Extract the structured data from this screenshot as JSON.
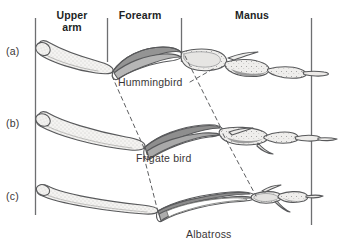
{
  "figure": {
    "background_color": "#ffffff",
    "line_color": "#58595b",
    "bone_fill_light": "#f2f1ef",
    "bone_fill_shadow": "#8e8e8e",
    "text_color": "#3a3637"
  },
  "columns": {
    "headers": [
      {
        "id": "upper-arm",
        "label": "Upper\narm",
        "line1": "Upper",
        "line2": "arm"
      },
      {
        "id": "forearm",
        "label": "Forearm"
      },
      {
        "id": "manus",
        "label": "Manus"
      }
    ],
    "divider_count": 4
  },
  "rows": [
    {
      "id": "a",
      "label": "(a)",
      "species": "Hummingbird"
    },
    {
      "id": "b",
      "label": "(b)",
      "species": "Frigate bird"
    },
    {
      "id": "c",
      "label": "(c)",
      "species": "Albatross"
    }
  ],
  "species_labels": {
    "a": "Hummingbird",
    "b": "Frigate bird",
    "c": "Albatross"
  },
  "connectors": {
    "style": "dashed",
    "description": "Dashed lines link homologous elbow and wrist joints across the three wings"
  }
}
